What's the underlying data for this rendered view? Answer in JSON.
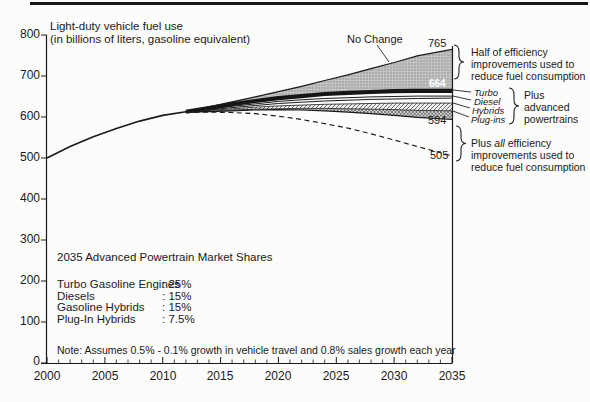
{
  "title": {
    "line1": "Light-duty vehicle fuel use",
    "line2": "(in billions of liters, gasoline equivalent)"
  },
  "annotations": {
    "no_change_label": "No Change",
    "end_values": {
      "no_change": "765",
      "half_efficiency": "664",
      "advanced": "594",
      "all_efficiency": "505"
    },
    "half_efficiency": {
      "line1": "Half of efficiency",
      "line2": "improvements used to",
      "line3": "reduce fuel consumption"
    },
    "powertrains": {
      "turbo": "Turbo",
      "diesel": "Diesel",
      "hybrids": "Hybrids",
      "plugins": "Plug-ins"
    },
    "plus_advanced": {
      "line1": "Plus",
      "line2": "advanced",
      "line3": "powertrains"
    },
    "all_efficiency": {
      "line1_pre": "Plus ",
      "line1_em": "all",
      "line1_post": " efficiency",
      "line2": "improvements used to",
      "line3": "reduce fuel consumption"
    }
  },
  "inset": {
    "title": "2035 Advanced Powertrain Market Shares",
    "rows": [
      {
        "label": "Turbo Gasoline Engines",
        "value": ": 25%"
      },
      {
        "label": "Diesels",
        "value": ": 15%"
      },
      {
        "label": "Gasoline Hybrids",
        "value": ": 15%"
      },
      {
        "label": "Plug-In Hybrids",
        "value": ": 7.5%"
      }
    ]
  },
  "note": "Note: Assumes 0.5% - 0.1% growth in vehicle travel and 0.8% sales growth each year",
  "chart_data": {
    "type": "area",
    "title": "Light-duty vehicle fuel use (in billions of liters, gasoline equivalent)",
    "xlabel": "Year",
    "ylabel": "Fuel use (billions of liters, gasoline equivalent)",
    "xlim": [
      2000,
      2035
    ],
    "ylim": [
      0,
      800
    ],
    "grid": false,
    "x_ticks": [
      2000,
      2005,
      2010,
      2015,
      2020,
      2025,
      2030,
      2035
    ],
    "y_ticks": [
      800,
      700,
      600,
      500,
      400,
      300,
      200,
      100,
      0
    ],
    "branch_year": 2012,
    "x": [
      2000,
      2002,
      2004,
      2006,
      2008,
      2010,
      2012,
      2014,
      2016,
      2018,
      2020,
      2022,
      2024,
      2026,
      2028,
      2030,
      2032,
      2035
    ],
    "series": [
      {
        "name": "no_change",
        "label": "No Change",
        "end_value_2035": 765,
        "values": [
          500,
          528,
          552,
          572,
          590,
          604,
          613,
          625,
          637,
          649,
          662,
          675,
          689,
          703,
          718,
          733,
          749,
          765
        ]
      },
      {
        "name": "half_efficiency",
        "label": "Half of efficiency improvements used to reduce fuel consumption",
        "end_value_2035": 664,
        "values": [
          500,
          528,
          552,
          572,
          590,
          604,
          613,
          622,
          631,
          639,
          646,
          651,
          656,
          659,
          661,
          663,
          664,
          664
        ]
      },
      {
        "name": "turbo",
        "label": "Turbo",
        "end_value_2035": 651,
        "values": [
          500,
          528,
          552,
          572,
          590,
          604,
          613,
          619,
          626,
          632,
          638,
          642,
          645,
          647,
          649,
          650,
          651,
          651
        ]
      },
      {
        "name": "diesel",
        "label": "Diesel",
        "end_value_2035": 646,
        "values": [
          500,
          528,
          552,
          572,
          590,
          604,
          613,
          617,
          623,
          628,
          633,
          636,
          639,
          641,
          643,
          644,
          645,
          646
        ]
      },
      {
        "name": "hybrids_top",
        "label": "Hybrids (top boundary)",
        "end_value_2035": 634,
        "values": [
          500,
          528,
          552,
          572,
          590,
          604,
          613,
          616,
          620,
          624,
          627,
          629,
          631,
          632,
          633,
          634,
          634,
          634
        ]
      },
      {
        "name": "hybrids_bottom",
        "label": "Hybrids (bottom boundary)",
        "end_value_2035": 615,
        "values": [
          500,
          528,
          552,
          572,
          590,
          604,
          612,
          614,
          617,
          619,
          620,
          621,
          621,
          620,
          619,
          618,
          616,
          615
        ]
      },
      {
        "name": "plus_advanced_powertrains",
        "label": "Plus advanced powertrains",
        "end_value_2035": 594,
        "values": [
          500,
          528,
          552,
          572,
          590,
          604,
          612,
          613,
          615,
          617,
          618,
          617,
          615,
          612,
          608,
          604,
          599,
          594
        ]
      },
      {
        "name": "plus_all_efficiency",
        "label": "Plus all efficiency improvements used to reduce fuel consumption",
        "end_value_2035": 505,
        "style": "dashed",
        "values": [
          500,
          528,
          552,
          572,
          590,
          604,
          611,
          612,
          611,
          608,
          602,
          594,
          584,
          573,
          559,
          544,
          528,
          505
        ]
      }
    ],
    "colors": {
      "line": "#1a1a1a",
      "wedge_fill_base": "#c4c4c4",
      "wedge_dot": "#8b8b8b",
      "dark_band": "#161616",
      "hatch_line": "#5a5a5a",
      "label_on_dark": "#ffffff"
    }
  }
}
